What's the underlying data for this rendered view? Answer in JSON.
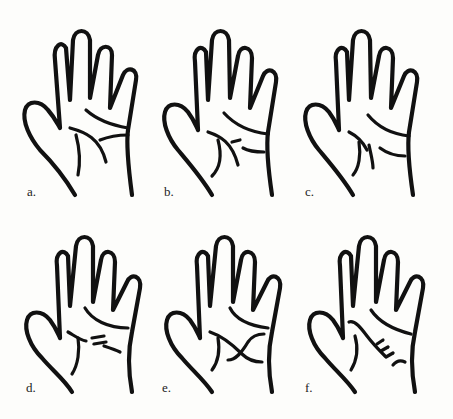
{
  "figure": {
    "panels": [
      {
        "label": "a.",
        "variant": "lines join: heart line curves down to wrist-side, life line short"
      },
      {
        "label": "b.",
        "variant": "head line with fork near thumb side"
      },
      {
        "label": "c.",
        "variant": "separated head and life lines"
      },
      {
        "label": "d.",
        "variant": "broken / dashed head line"
      },
      {
        "label": "e.",
        "variant": "crossing lines forming an X"
      },
      {
        "label": "f.",
        "variant": "chained / hatched line segment"
      }
    ]
  }
}
